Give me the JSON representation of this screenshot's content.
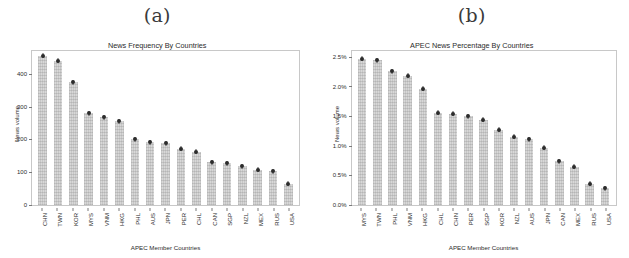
{
  "figure": {
    "panels": [
      {
        "caption": "(a)",
        "title": "News Frequency By Countries",
        "ylabel": "News volume",
        "xlabel": "APEC Member Countries",
        "yticks": [
          "0",
          "100",
          "200",
          "300",
          "400"
        ]
      },
      {
        "caption": "(b)",
        "title": "APEC News Percentage By Countries",
        "ylabel": "News volume",
        "xlabel": "APEC Member Countries",
        "yticks": [
          "0.0%",
          "0.5%",
          "1.0%",
          "1.5%",
          "2.0%",
          "2.5%"
        ]
      }
    ]
  },
  "chart_data": [
    {
      "type": "bar",
      "title": "News Frequency By Countries",
      "xlabel": "APEC Member Countries",
      "ylabel": "News volume",
      "ylim": [
        0,
        470
      ],
      "ytick_values": [
        0,
        100,
        200,
        300,
        400
      ],
      "ytick_labels": [
        "0",
        "100",
        "200",
        "300",
        "400"
      ],
      "grid": false,
      "legend": "none",
      "categories": [
        "CHN",
        "TWN",
        "KOR",
        "MYS",
        "VNM",
        "HKG",
        "PHL",
        "AUS",
        "JPN",
        "PER",
        "CHL",
        "CAN",
        "SGP",
        "NZL",
        "MEX",
        "RUS",
        "USA"
      ],
      "values": [
        455,
        440,
        375,
        280,
        268,
        255,
        200,
        192,
        189,
        172,
        162,
        130,
        128,
        118,
        108,
        103,
        65
      ]
    },
    {
      "type": "bar",
      "title": "APEC News Percentage By Countries",
      "xlabel": "APEC Member Countries",
      "ylabel": "News volume",
      "ylim": [
        0,
        2.6
      ],
      "ytick_values": [
        0.0,
        0.5,
        1.0,
        1.5,
        2.0,
        2.5
      ],
      "ytick_labels": [
        "0.0%",
        "0.5%",
        "1.0%",
        "1.5%",
        "2.0%",
        "2.5%"
      ],
      "grid": false,
      "legend": "none",
      "categories": [
        "MYS",
        "TWN",
        "PHL",
        "VNM",
        "HKG",
        "CHL",
        "CHN",
        "PER",
        "SGP",
        "KOR",
        "NZL",
        "AUS",
        "JPN",
        "CAN",
        "MEX",
        "RUS",
        "USA"
      ],
      "values": [
        2.47,
        2.44,
        2.26,
        2.18,
        1.96,
        1.56,
        1.54,
        1.5,
        1.44,
        1.27,
        1.15,
        1.11,
        0.97,
        0.74,
        0.65,
        0.36,
        0.28
      ]
    }
  ]
}
